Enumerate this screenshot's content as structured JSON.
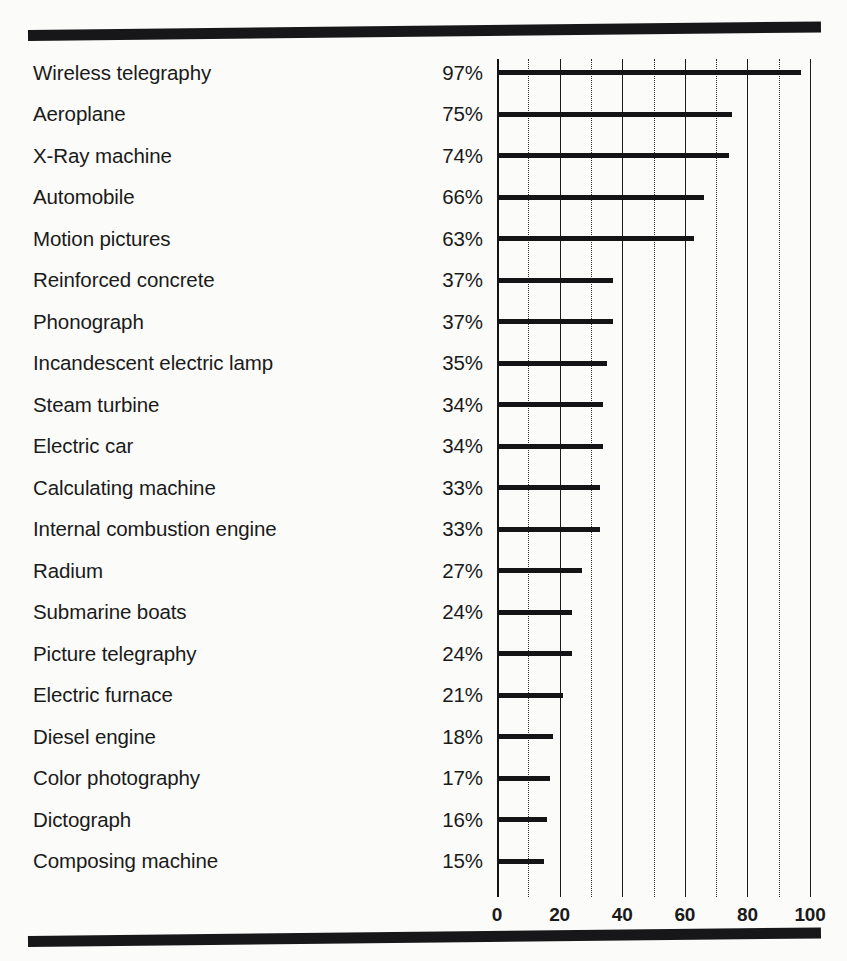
{
  "chart_data": {
    "type": "bar",
    "orientation": "horizontal",
    "title": "",
    "subtitle": "",
    "xlabel": "",
    "ylabel": "",
    "xlim": [
      0,
      100
    ],
    "grid": true,
    "legend": null,
    "value_suffix": "%",
    "x_ticks": [
      0,
      20,
      40,
      60,
      80,
      100
    ],
    "x_tick_labels": [
      "0",
      "20",
      "40",
      "60",
      "80",
      "100"
    ],
    "x_minor_ticks": [
      10,
      30,
      50,
      70,
      90
    ],
    "categories": [
      "Wireless telegraphy",
      "Aeroplane",
      "X-Ray machine",
      "Automobile",
      "Motion pictures",
      "Reinforced concrete",
      "Phonograph",
      "Incandescent electric lamp",
      "Steam turbine",
      "Electric car",
      "Calculating machine",
      "Internal combustion engine",
      "Radium",
      "Submarine boats",
      "Picture telegraphy",
      "Electric furnace",
      "Diesel engine",
      "Color photography",
      "Dictograph",
      "Composing machine"
    ],
    "values": [
      97,
      75,
      74,
      66,
      63,
      37,
      37,
      35,
      34,
      34,
      33,
      33,
      27,
      24,
      24,
      21,
      18,
      17,
      16,
      15
    ],
    "value_labels": [
      "97%",
      "75%",
      "74%",
      "66%",
      "63%",
      "37%",
      "37%",
      "35%",
      "34%",
      "34%",
      "33%",
      "33%",
      "27%",
      "24%",
      "24%",
      "21%",
      "18%",
      "17%",
      "16%",
      "15%"
    ],
    "colors": {
      "bar": "#141417",
      "text": "#1a1a1a",
      "major_gridline": "#1b1b1e",
      "minor_gridline": "#2a2a2d",
      "background": "#fbfbf9",
      "rule": "#17171a"
    }
  }
}
